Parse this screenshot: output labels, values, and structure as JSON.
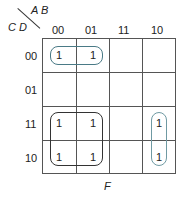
{
  "kmap": {
    "row_var": "C D",
    "col_var": "A B",
    "columns": [
      "00",
      "01",
      "11",
      "10"
    ],
    "rows": [
      "00",
      "01",
      "11",
      "10"
    ],
    "cells": [
      [
        "1",
        "1",
        "",
        ""
      ],
      [
        "",
        "",
        "",
        ""
      ],
      [
        "1",
        "1",
        "",
        "1"
      ],
      [
        "1",
        "1",
        "",
        "1"
      ]
    ],
    "function_label": "F",
    "groups": [
      {
        "name": "group-row00-cols00-01",
        "color": "#4a7a86"
      },
      {
        "name": "group-quad-rows11-10-cols00-01",
        "color": "#333333"
      },
      {
        "name": "group-col10-rows11-10",
        "color": "#6f9aa3"
      }
    ]
  }
}
